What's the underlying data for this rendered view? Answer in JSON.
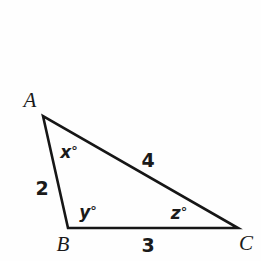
{
  "figure": {
    "kind": "geometry-diagram",
    "shape": "triangle",
    "background_color": "#fefefe",
    "stroke_color": "#161616",
    "stroke_width": 2.6,
    "canvas": {
      "width": 261,
      "height": 261
    }
  },
  "vertices": [
    {
      "name": "A",
      "label": "A",
      "x": 43,
      "y": 116,
      "label_x": 30,
      "label_y": 100
    },
    {
      "name": "B",
      "label": "B",
      "x": 68,
      "y": 228,
      "label_x": 63,
      "label_y": 244
    },
    {
      "name": "C",
      "label": "C",
      "x": 238,
      "y": 228,
      "label_x": 246,
      "label_y": 243
    }
  ],
  "sides": [
    {
      "name": "AB",
      "label": "2",
      "value": 2,
      "label_x": 42,
      "label_y": 188
    },
    {
      "name": "AC",
      "label": "4",
      "value": 4,
      "label_x": 148,
      "label_y": 160
    },
    {
      "name": "BC",
      "label": "3",
      "value": 3,
      "label_x": 148,
      "label_y": 245
    }
  ],
  "angles": [
    {
      "name": "A",
      "variable": "x",
      "label": "x",
      "degree_symbol": "°",
      "label_x": 69,
      "label_y": 152
    },
    {
      "name": "B",
      "variable": "y",
      "label": "y",
      "degree_symbol": "°",
      "label_x": 88,
      "label_y": 212
    },
    {
      "name": "C",
      "variable": "z",
      "label": "z",
      "degree_symbol": "°",
      "label_x": 179,
      "label_y": 213
    }
  ],
  "chart_data": {
    "type": "diagram",
    "title": "",
    "points": {
      "A": [
        43,
        116
      ],
      "B": [
        68,
        228
      ],
      "C": [
        238,
        228
      ]
    },
    "edge_labels": {
      "AB": "2",
      "AC": "4",
      "BC": "3"
    },
    "angle_labels": {
      "A": "x°",
      "B": "y°",
      "C": "z°"
    }
  }
}
